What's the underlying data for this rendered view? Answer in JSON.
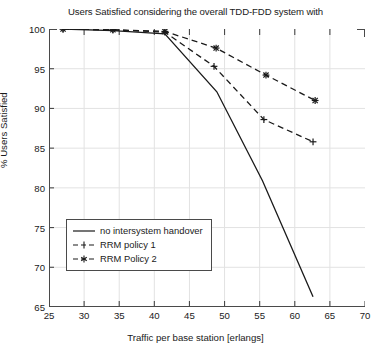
{
  "chart_data": {
    "type": "line",
    "title": "Users Satisfied considering the overall TDD-FDD system with",
    "xlabel": "Traffic per base station [erlangs]",
    "ylabel": "% Users Satisfied",
    "xlim": [
      25,
      70
    ],
    "ylim": [
      65,
      100
    ],
    "xticks": [
      25,
      30,
      35,
      40,
      45,
      50,
      55,
      60,
      65,
      70
    ],
    "yticks": [
      65,
      70,
      75,
      80,
      85,
      90,
      95,
      100
    ],
    "grid": true,
    "legend_position": "lower left",
    "series": [
      {
        "name": "no intersystem handover",
        "style": "solid",
        "marker": "none",
        "color": "#1a1a1a",
        "x": [
          27.0,
          34.1,
          41.5,
          48.9,
          55.4,
          62.6
        ],
        "y": [
          100.0,
          99.8,
          99.4,
          92.1,
          80.9,
          66.3
        ]
      },
      {
        "name": "RRM policy 1",
        "style": "dashed",
        "marker": "plus",
        "color": "#1a1a1a",
        "x": [
          27.0,
          34.1,
          41.5,
          48.5,
          55.6,
          62.6
        ],
        "y": [
          100.0,
          99.9,
          99.6,
          95.3,
          88.6,
          85.8
        ]
      },
      {
        "name": "RRM Policy 2",
        "style": "dashed",
        "marker": "star",
        "color": "#1a1a1a",
        "x": [
          27.0,
          34.1,
          41.5,
          48.8,
          55.9,
          62.9
        ],
        "y": [
          100.0,
          99.9,
          99.7,
          97.6,
          94.2,
          91.0
        ]
      }
    ]
  },
  "legend": {
    "items": [
      {
        "label": "no intersystem handover"
      },
      {
        "label": "RRM policy 1"
      },
      {
        "label": "RRM Policy 2"
      }
    ]
  }
}
